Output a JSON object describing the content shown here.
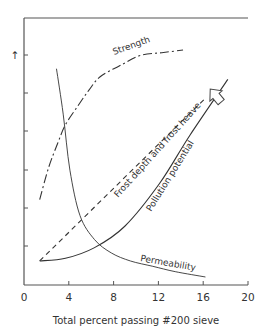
{
  "chart_data": {
    "type": "line",
    "title": "",
    "xlabel": "Total percent passing #200 sieve",
    "ylabel": "",
    "ylabel_arrow": "increasing",
    "xlim": [
      0,
      20
    ],
    "ylim": [
      0,
      100
    ],
    "y_units": "relative (unlabeled)",
    "xticks": [
      0,
      4,
      8,
      12,
      16,
      20
    ],
    "xtick_labels": [
      "0",
      "4",
      "8",
      "12",
      "16",
      "20"
    ],
    "ytick_count": 6,
    "grid": false,
    "legend": "none (curves labeled inline)",
    "series": [
      {
        "name": "Strength",
        "line_style": "dash-dot",
        "x": [
          1.4,
          2.2,
          3.0,
          3.7,
          4.8,
          5.8,
          6.8,
          8.5,
          10.4,
          12.3,
          14.2
        ],
        "y": [
          32,
          44,
          53,
          60,
          67,
          73,
          78,
          82,
          86,
          87,
          88
        ]
      },
      {
        "name": "Permeability",
        "line_style": "solid-thin",
        "x": [
          2.9,
          3.5,
          4.1,
          5.0,
          6.3,
          7.8,
          9.5,
          11.5,
          13.5,
          16.2
        ],
        "y": [
          81,
          64,
          43,
          26,
          17,
          12,
          9,
          7,
          5,
          3
        ]
      },
      {
        "name": "Frost depth and frost heave",
        "line_style": "dashed",
        "x": [
          1.4,
          16.2
        ],
        "y": [
          9,
          70
        ]
      },
      {
        "name": "Pollution potential",
        "line_style": "solid",
        "x": [
          1.4,
          3.7,
          6.3,
          9.0,
          12.1,
          14.8,
          18.2
        ],
        "y": [
          9,
          10,
          14,
          22,
          38,
          56,
          77
        ]
      }
    ],
    "annotations": [
      {
        "text": "Strength",
        "x": 9.3,
        "y": 88,
        "rotation": -20
      },
      {
        "text": "Frost depth and frost heave",
        "x": 11.0,
        "y": 45,
        "rotation": -48
      },
      {
        "text": "Pollution potential",
        "x": 14.8,
        "y": 42,
        "rotation": -58
      },
      {
        "text": "Permeability",
        "x": 13.0,
        "y": 7,
        "rotation": 10
      },
      {
        "text": "hollow arrow pointing up-right (increasing pollution potential)",
        "x": 17.2,
        "y": 66
      }
    ]
  },
  "labels": {
    "x_axis_title": "Total percent passing #200 sieve",
    "x_ticks": [
      "0",
      "4",
      "8",
      "12",
      "16",
      "20"
    ],
    "strength": "Strength",
    "frost": "Frost depth and frost heave",
    "pollution": "Pollution potential",
    "permeability": "Permeability",
    "y_arrow": "↑"
  }
}
